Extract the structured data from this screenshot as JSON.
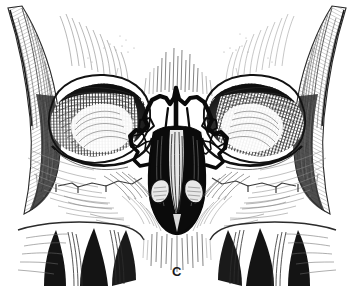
{
  "figure": {
    "label": "C",
    "medium": "pen-and-ink line engraving",
    "background_color": "#ffffff",
    "ink_color": "#111111",
    "midtone_color": "#4a4a4a",
    "light_hatch_color": "#777777",
    "width": 354,
    "height": 286
  },
  "structures": [
    {
      "name": "left-zygomatic-arch",
      "side": "left",
      "shading": "fine-parallel-hatching"
    },
    {
      "name": "right-zygomatic-arch",
      "side": "right",
      "shading": "fine-parallel-hatching"
    },
    {
      "name": "left-orbit",
      "side": "left",
      "shading": "dense-cross-hatching"
    },
    {
      "name": "right-orbit",
      "side": "right",
      "shading": "dense-cross-hatching"
    },
    {
      "name": "nasal-bridge",
      "side": "midline",
      "shading": "heavy-black-fracture-lines"
    },
    {
      "name": "nasal-aperture",
      "side": "midline",
      "shading": "solid-black"
    },
    {
      "name": "nasal-septum-vomer",
      "side": "midline",
      "shading": "vertical-hatching"
    },
    {
      "name": "inferior-turbinate-left",
      "side": "left",
      "shading": "light-stipple"
    },
    {
      "name": "inferior-turbinate-right",
      "side": "right",
      "shading": "light-stipple"
    },
    {
      "name": "left-maxilla",
      "side": "left",
      "shading": "sparse-hatching"
    },
    {
      "name": "right-maxilla",
      "side": "right",
      "shading": "sparse-hatching"
    },
    {
      "name": "upper-teeth",
      "side": "midline",
      "shading": "dark-interdental-shadow"
    },
    {
      "name": "frontal-bone-glabella",
      "side": "midline",
      "shading": "sparse-hatching"
    },
    {
      "name": "naso-orbital-ethmoid-fracture",
      "side": "midline",
      "shading": "heavy-black-outline"
    }
  ]
}
